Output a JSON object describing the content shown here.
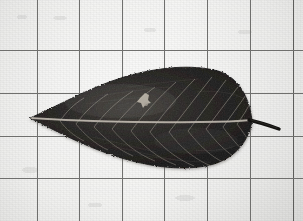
{
  "image": {
    "kind": "photograph",
    "subject": "pressed leaf on graph paper",
    "tone": "black-and-white / grayscale",
    "width": 303,
    "height": 221
  },
  "background": {
    "name": "graph-paper-sheet",
    "paper_color": "#ecece9",
    "paper_shadow_color": "#d7d7d4",
    "grid_line_color": "#6f6f6d",
    "grid_border_color": "#5d5d5b",
    "grid_cell_width": 43,
    "grid_cell_height": 43,
    "vertical_lines_x": [
      37,
      79,
      122,
      164,
      207,
      250,
      293
    ],
    "horizontal_lines_y": [
      50,
      93,
      136,
      178
    ]
  },
  "leaf": {
    "name": "pressed-leaf",
    "common_form": "lanceolate / elliptic-lanceolate blade",
    "color": "#1d1c1a",
    "color_highlight": "#4a4744",
    "margin": "finely serrate",
    "venation": "pinnate",
    "vein_color": "#8b867e",
    "midrib_color": "#a7a199",
    "tip_point_x": 30,
    "tip_point_y": 118,
    "base_x": 252,
    "base_y": 121,
    "widest_y_top": 66,
    "widest_y_bottom": 156,
    "blade_length_px": 222,
    "blade_width_px": 90,
    "lateral_vein_pairs": 11,
    "blemish": {
      "name": "light-blemish-spot",
      "x": 147,
      "y": 98,
      "color": "#b9b2a8"
    },
    "petiole": {
      "name": "leaf-petiole",
      "color": "#141311",
      "start_x": 252,
      "start_y": 121,
      "end_x": 279,
      "end_y": 129,
      "length_px": 28
    }
  }
}
